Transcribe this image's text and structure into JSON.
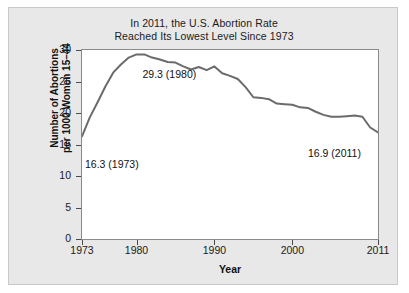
{
  "chart_data": {
    "type": "line",
    "title": "In 2011, the U.S. Abortion Rate Reached Its Lowest Level Since 1973",
    "title_lines": [
      "In 2011, the U.S. Abortion Rate",
      "Reached Its Lowest Level Since 1973"
    ],
    "xlabel": "Year",
    "ylabel": "Number of Abortions per 1000 Women 15–44",
    "ylabel_lines": [
      "Number of Abortions",
      "per 1000 Women 15–44"
    ],
    "xlim": [
      1973,
      2011
    ],
    "ylim": [
      0,
      30
    ],
    "yticks": [
      0,
      5,
      10,
      15,
      20,
      25,
      30
    ],
    "ytick_labels": [
      "0",
      "5",
      "10",
      "15",
      "20",
      "25",
      "30"
    ],
    "xticks": [
      1973,
      1980,
      1990,
      2000,
      2011
    ],
    "xtick_labels": [
      "1973",
      "1980",
      "1990",
      "2000",
      "2011"
    ],
    "grid": false,
    "legend": "none",
    "line_color": "#6b6b6b",
    "line_width": 2,
    "x": [
      1973,
      1974,
      1975,
      1976,
      1977,
      1978,
      1979,
      1980,
      1981,
      1982,
      1983,
      1984,
      1985,
      1986,
      1987,
      1988,
      1989,
      1990,
      1991,
      1992,
      1993,
      1994,
      1995,
      1996,
      1997,
      1998,
      1999,
      2000,
      2001,
      2002,
      2003,
      2004,
      2005,
      2006,
      2007,
      2008,
      2009,
      2010,
      2011
    ],
    "values": [
      16.3,
      19.3,
      21.7,
      24.2,
      26.4,
      27.7,
      28.8,
      29.3,
      29.3,
      28.8,
      28.5,
      28.1,
      28.0,
      27.4,
      26.9,
      27.3,
      26.8,
      27.4,
      26.3,
      25.9,
      25.4,
      24.1,
      22.5,
      22.4,
      22.2,
      21.5,
      21.4,
      21.3,
      20.9,
      20.8,
      20.2,
      19.7,
      19.4,
      19.4,
      19.5,
      19.6,
      19.4,
      17.7,
      16.9
    ]
  },
  "annotations": [
    {
      "name": "peak-annotation",
      "text": "29.3 (1980)",
      "year": 1980,
      "value": 29.3
    },
    {
      "name": "start-annotation",
      "text": "16.3 (1973)",
      "year": 1973,
      "value": 16.3
    },
    {
      "name": "end-annotation",
      "text": "16.9 (2011)",
      "year": 2011,
      "value": 16.9
    }
  ]
}
